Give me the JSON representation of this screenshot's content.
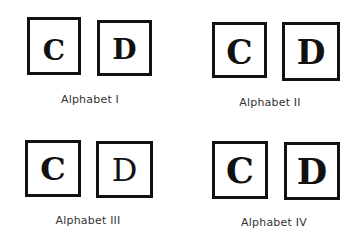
{
  "groups": [
    {
      "label": "Alphabet I",
      "letters": [
        "C",
        "D"
      ]
    },
    {
      "label": "Alphabet II",
      "letters": [
        "C",
        "D"
      ]
    },
    {
      "label": "Alphabet III",
      "letters": [
        "C",
        "D"
      ]
    },
    {
      "label": "Alphabet IV",
      "letters": [
        "C",
        "D"
      ]
    }
  ]
}
